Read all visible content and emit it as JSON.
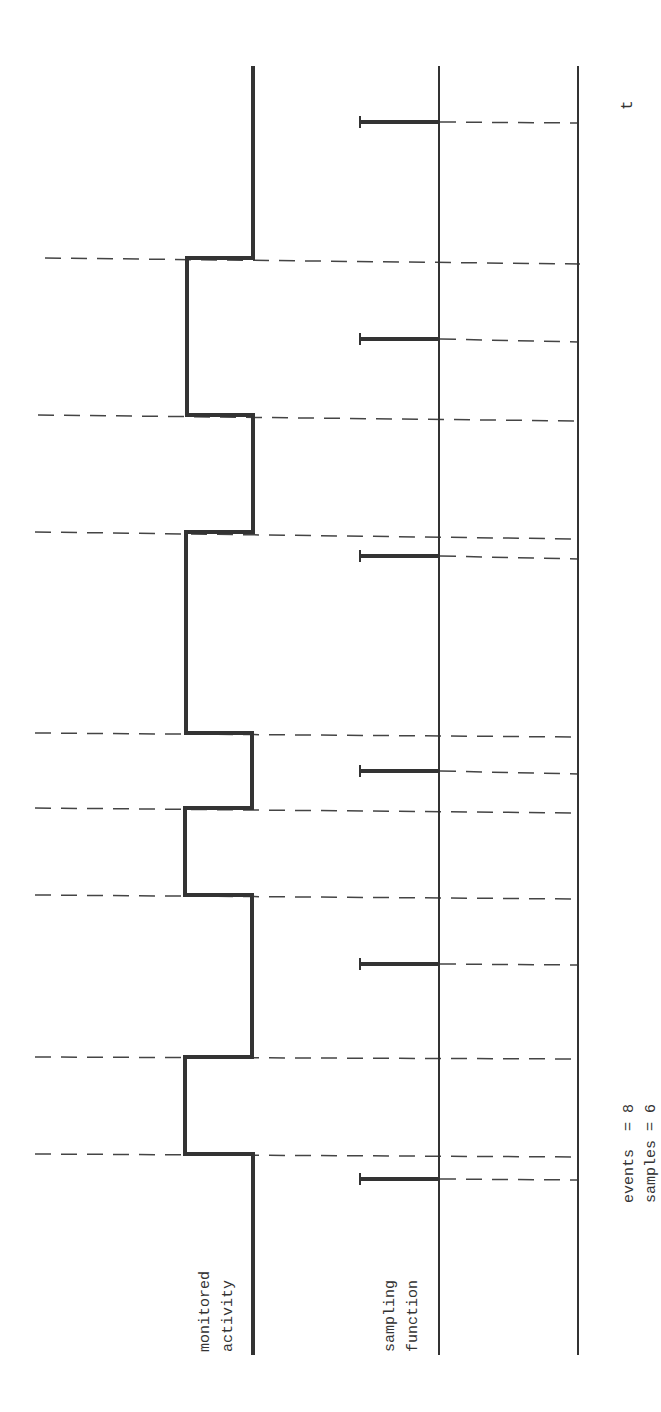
{
  "diagram": {
    "orientation": "rotated-90-ccw",
    "colors": {
      "ink": "#333333",
      "background": "#ffffff"
    },
    "labels": {
      "monitored_activity_line1": "monitored",
      "monitored_activity_line2": "activity",
      "sampling_function_line1": "sampling",
      "sampling_function_line2": "function",
      "time_axis": "t",
      "events_summary": "events  = 8",
      "samples_summary": "samples = 6"
    },
    "tracks": [
      {
        "name": "monitored activity",
        "type": "square-wave",
        "transitions": 8
      },
      {
        "name": "sampling function",
        "type": "impulse-train",
        "samples": 6
      },
      {
        "name": "time axis",
        "type": "axis",
        "label": "t"
      }
    ],
    "counts": {
      "events": 8,
      "samples": 6
    }
  }
}
